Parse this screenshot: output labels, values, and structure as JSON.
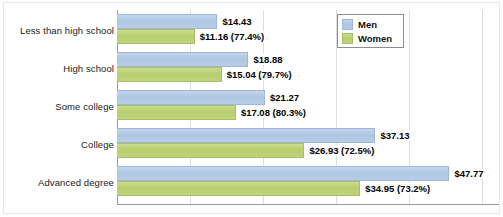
{
  "chart_data": {
    "type": "bar",
    "orientation": "horizontal",
    "title": "",
    "subtitle": "",
    "xlabel": "",
    "ylabel": "",
    "grid": true,
    "xlim": [
      0,
      55
    ],
    "gridline_values": [
      10.5,
      21,
      31.5,
      42,
      52.5
    ],
    "categories": [
      "Less than high school",
      "High school",
      "Some college",
      "College",
      "Advanced degree"
    ],
    "legend_position": "top-right",
    "series": [
      {
        "name": "Men",
        "color": "#b4cbe6",
        "values": [
          14.43,
          18.88,
          21.27,
          37.13,
          47.77
        ],
        "labels": [
          "$14.43",
          "$18.88",
          "$21.27",
          "$37.13",
          "$47.77"
        ]
      },
      {
        "name": "Women",
        "color": "#bcd178",
        "values": [
          11.16,
          15.04,
          17.08,
          26.93,
          34.95
        ],
        "labels": [
          "$11.16 (77.4%)",
          "$15.04 (79.7%)",
          "$17.08 (80.3%)",
          "$26.93 (72.5%)",
          "$34.95 (73.2%)"
        ],
        "percent_of_men": [
          77.4,
          79.7,
          80.3,
          72.5,
          73.2
        ]
      }
    ]
  },
  "legend": {
    "items": [
      {
        "label": "Men",
        "swatch": "men"
      },
      {
        "label": "Women",
        "swatch": "women"
      }
    ]
  },
  "colors": {
    "men_fill": "#b4cbe6",
    "men_border": "#9fb6d4",
    "women_fill": "#bcd178",
    "women_border": "#a8bf63",
    "axis": "#9a9a9a",
    "gridline": "#dcdce2",
    "text": "#111111"
  }
}
